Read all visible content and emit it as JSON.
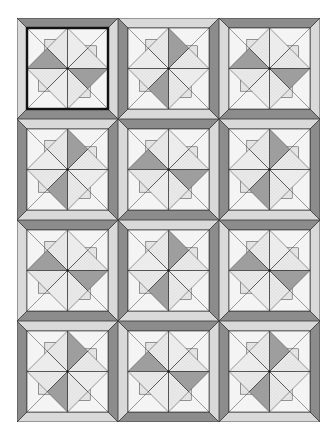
{
  "quilt": {
    "name": "pinwheel-quilt",
    "rows": 4,
    "cols": 3,
    "block_size": 101,
    "selected_block": 0,
    "layout": [
      [
        "A",
        "B",
        "A"
      ],
      [
        "B",
        "A",
        "B"
      ],
      [
        "A",
        "B",
        "A"
      ],
      [
        "B",
        "A",
        "B"
      ]
    ]
  },
  "colors": {
    "background": "#ffffff",
    "frame_dark": "#8c8c8c",
    "frame_light": "#d9d9d9",
    "blade_dark": "#9e9e9e",
    "fabric_light": "#f4f4f4",
    "fabric_dotted": "#e6e6e6",
    "fabric_hatch": "#ececec",
    "line": "#333333",
    "selection": "#111111"
  }
}
